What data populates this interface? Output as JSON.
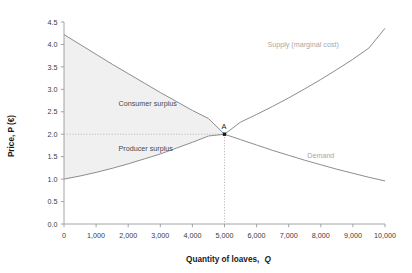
{
  "chart_data": {
    "type": "line",
    "title": "",
    "xlabel": "Quantity of loaves, Q",
    "xlabel_plain": "Quantity of loaves,",
    "xlabel_italic": "Q",
    "ylabel": "Price, P (€)",
    "xlim": [
      0,
      10000
    ],
    "ylim": [
      0.0,
      4.5
    ],
    "grid": false,
    "legend_position": "inline-curve-labels",
    "xticks": [
      0,
      1000,
      2000,
      3000,
      4000,
      5000,
      6000,
      7000,
      8000,
      9000,
      10000
    ],
    "xtick_labels": [
      "0",
      "1,000",
      "2,000",
      "3,000",
      "4,000",
      "5,000",
      "6,000",
      "7,000",
      "8,000",
      "9,000",
      "10,000"
    ],
    "yticks": [
      0.0,
      0.5,
      1.0,
      1.5,
      2.0,
      2.5,
      3.0,
      3.5,
      4.0,
      4.5
    ],
    "ytick_labels": [
      "0.0",
      "0.5",
      "1.0",
      "1.5",
      "2.0",
      "2.5",
      "3.0",
      "3.5",
      "4.0",
      "4.5"
    ],
    "series": [
      {
        "name": "Demand",
        "label": "Demand",
        "label_x": 8000,
        "label_y": 1.48,
        "color": "#8d8d8d",
        "x": [
          0,
          500,
          1000,
          1500,
          2000,
          2500,
          3000,
          3500,
          4000,
          4500,
          5000,
          5500,
          6000,
          6500,
          7000,
          7500,
          8000,
          8500,
          9000,
          9500,
          10000
        ],
        "values": [
          4.22,
          4.0,
          3.78,
          3.56,
          3.35,
          3.14,
          2.93,
          2.73,
          2.53,
          2.35,
          2.0,
          1.88,
          1.76,
          1.64,
          1.53,
          1.42,
          1.32,
          1.22,
          1.13,
          1.04,
          0.96
        ]
      },
      {
        "name": "Supply (marginal cost)",
        "label": "Supply (marginal cost)",
        "label_x": 7450,
        "label_y": 3.95,
        "color": "#8d8d8d",
        "x": [
          0,
          500,
          1000,
          1500,
          2000,
          2500,
          3000,
          3500,
          4000,
          4500,
          5000,
          5500,
          6000,
          6500,
          7000,
          7500,
          8000,
          8500,
          9000,
          9500,
          10000
        ],
        "values": [
          1.0,
          1.07,
          1.15,
          1.24,
          1.34,
          1.45,
          1.56,
          1.69,
          1.82,
          1.96,
          2.0,
          2.27,
          2.44,
          2.62,
          2.81,
          3.01,
          3.22,
          3.44,
          3.67,
          3.92,
          4.36
        ]
      }
    ],
    "regions": [
      {
        "name": "consumer-surplus",
        "label": "Consumer surplus",
        "label_x": 1700,
        "label_y": 2.62,
        "fill": "#f0f0f0",
        "bounds": "between demand curve and P=2.00, from Q=0 to Q=5000"
      },
      {
        "name": "producer-surplus",
        "label": "Producer surplus",
        "label_x": 1700,
        "label_y": 1.62,
        "fill": "#f0f0f0",
        "bounds": "between P=2.00 and supply curve, from Q=0 to Q=5000"
      }
    ],
    "annotations": [
      {
        "name": "equilibrium-point",
        "label": "A",
        "x": 5000,
        "y": 2.0,
        "marker": "square-dot",
        "color": "#1a1a1a",
        "guides": [
          "horizontal dotted line at P=2.0 from Q=0 to Q=5000",
          "vertical dotted line at Q=5000 from P=0 to P=2.0"
        ]
      }
    ],
    "colors": {
      "curve": "#8d8d8d",
      "axis": "#9a9a9a",
      "surplus_fill": "#f0f0f0",
      "guide": "#b4b4b4",
      "tick_text": "#3a3a3a",
      "curve_label": "#a8a8a8",
      "background": "#ffffff"
    }
  }
}
